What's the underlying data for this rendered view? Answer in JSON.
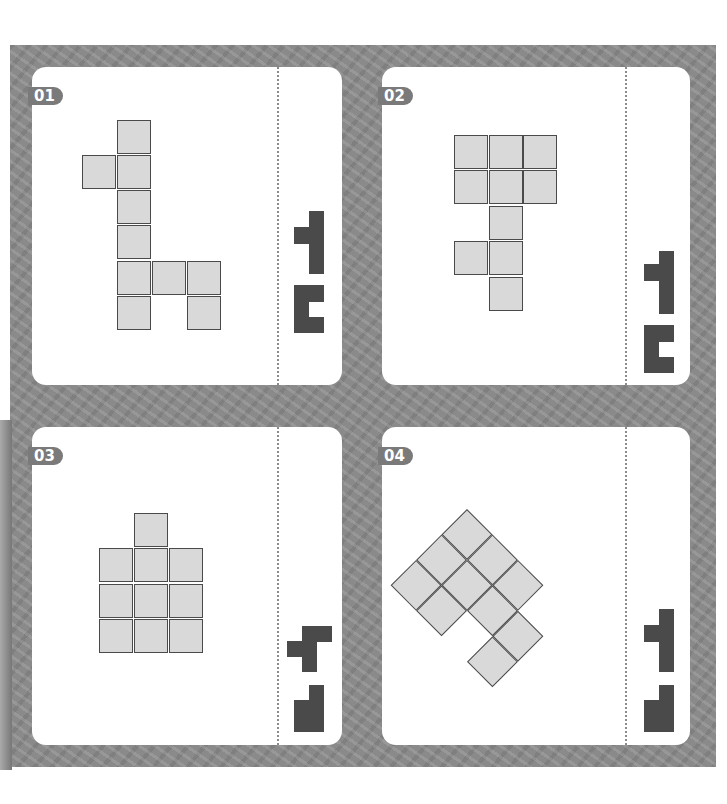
{
  "puzzles": [
    {
      "label": "01",
      "cells": [
        [
          1,
          0
        ],
        [
          0,
          1
        ],
        [
          1,
          1
        ],
        [
          1,
          2
        ],
        [
          1,
          3
        ],
        [
          1,
          4
        ],
        [
          2,
          4
        ],
        [
          3,
          4
        ],
        [
          1,
          5
        ],
        [
          3,
          5
        ]
      ]
    },
    {
      "label": "02",
      "cells": [
        [
          0,
          0
        ],
        [
          1,
          0
        ],
        [
          2,
          0
        ],
        [
          0,
          1
        ],
        [
          1,
          1
        ],
        [
          2,
          1
        ],
        [
          1,
          2
        ],
        [
          0,
          3
        ],
        [
          1,
          3
        ],
        [
          1,
          4
        ]
      ]
    },
    {
      "label": "03",
      "cells": [
        [
          1,
          0
        ],
        [
          0,
          1
        ],
        [
          1,
          1
        ],
        [
          2,
          1
        ],
        [
          0,
          2
        ],
        [
          1,
          2
        ],
        [
          2,
          2
        ],
        [
          0,
          3
        ],
        [
          1,
          3
        ],
        [
          2,
          3
        ]
      ]
    },
    {
      "label": "04",
      "cells": [
        [
          0,
          0
        ],
        [
          1,
          0
        ],
        [
          2,
          0
        ],
        [
          0,
          1
        ],
        [
          1,
          1
        ],
        [
          2,
          1
        ],
        [
          0,
          2
        ],
        [
          1,
          2
        ],
        [
          3,
          2
        ],
        [
          3,
          1
        ]
      ],
      "rotated_deg": 45
    }
  ],
  "colors": {
    "background": "#8a8a8a",
    "cell_fill": "#d9d9d9",
    "piece": "#4a4a4a",
    "badge": "#7a7a7a"
  }
}
